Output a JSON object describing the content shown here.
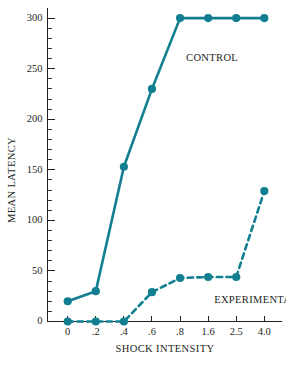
{
  "chart_data": {
    "type": "line",
    "title": "",
    "xlabel": "SHOCK INTENSITY",
    "ylabel": "MEAN LATENCY",
    "categories": [
      "0",
      ".2",
      ".4",
      ".6",
      ".8",
      "1.6",
      "2.5",
      "4.0"
    ],
    "ylim": [
      0,
      310
    ],
    "y_ticks_major": [
      0,
      50,
      100,
      150,
      200,
      250,
      300
    ],
    "y_tick_labels": [
      "0",
      "50",
      "100",
      "150",
      "200",
      "250",
      "300"
    ],
    "y_minor_step": 10,
    "grid": false,
    "legend_position": "inline-annotations",
    "series": [
      {
        "name": "CONTROL",
        "style": "solid",
        "color": "#117f90",
        "values": [
          20,
          30,
          153,
          230,
          300,
          300,
          300,
          300
        ]
      },
      {
        "name": "EXPERIMENTAL",
        "style": "dashed",
        "color": "#117f90",
        "values": [
          0,
          0,
          0,
          29,
          43,
          44,
          44,
          129
        ]
      }
    ],
    "annotations": [
      {
        "text": "CONTROL",
        "x_category": ".8",
        "y_value": 258
      },
      {
        "text": "EXPERIMENTAL",
        "x_category": "1.6",
        "y_value": 18
      }
    ]
  },
  "colors": {
    "series_teal": "#117f90",
    "axis_black": "#231f20",
    "background": "#ffffff"
  }
}
